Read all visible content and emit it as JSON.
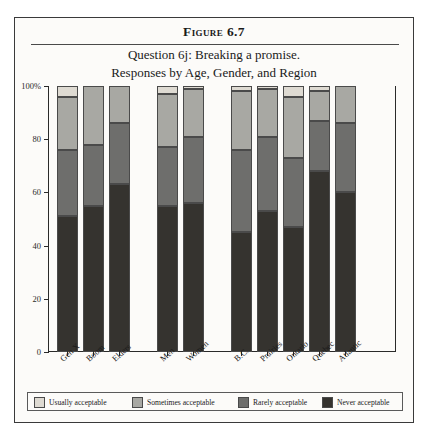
{
  "figure": {
    "number": "Figure 6.7",
    "title_line_1": "Question 6j: Breaking a promise.",
    "title_line_2": "Responses by Age, Gender, and Region"
  },
  "legend": {
    "items": [
      {
        "label": "Usually acceptable",
        "color": "#dedad2"
      },
      {
        "label": "Sometimes acceptable",
        "color": "#a8a8a3"
      },
      {
        "label": "Rarely acceptable",
        "color": "#6e6e6c"
      },
      {
        "label": "Never acceptable",
        "color": "#35332f"
      }
    ]
  },
  "chart_data": {
    "type": "bar",
    "subtype": "stacked-100-percent",
    "title": "Question 6j: Breaking a promise. Responses by Age, Gender, and Region",
    "xlabel": "",
    "ylabel": "",
    "ylim": [
      0,
      100
    ],
    "yticks": [
      0,
      20,
      40,
      60,
      80,
      100
    ],
    "ytick_labels": [
      "0",
      "20",
      "40",
      "60",
      "80",
      "100%"
    ],
    "grid": false,
    "legend_position": "bottom",
    "categories": [
      "Gen X",
      "Boom",
      "Elders",
      "Men",
      "Women",
      "B.C.",
      "Prairies",
      "Ontario",
      "Quebec",
      "Atlantic"
    ],
    "group_breaks": [
      3,
      5
    ],
    "series": [
      {
        "name": "Never acceptable",
        "color": "#35332f",
        "values": [
          51,
          55,
          63,
          55,
          56,
          45,
          53,
          47,
          68,
          60
        ]
      },
      {
        "name": "Rarely acceptable",
        "color": "#6e6e6c",
        "values": [
          25,
          23,
          23,
          22,
          25,
          31,
          28,
          26,
          19,
          26
        ]
      },
      {
        "name": "Sometimes acceptable",
        "color": "#a8a8a3",
        "values": [
          20,
          22,
          14,
          20,
          18,
          22,
          18,
          23,
          11,
          14
        ]
      },
      {
        "name": "Usually acceptable",
        "color": "#dedad2",
        "values": [
          4,
          0,
          0,
          3,
          1,
          2,
          1,
          4,
          2,
          0
        ]
      }
    ]
  }
}
